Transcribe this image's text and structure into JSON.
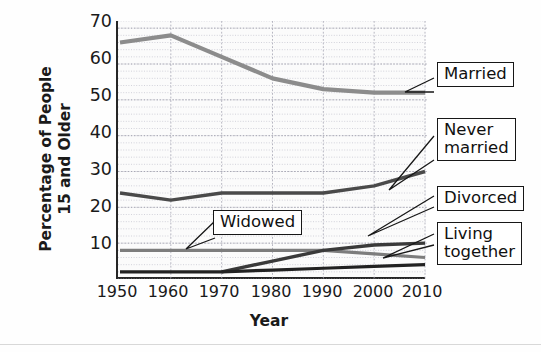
{
  "chart_data": {
    "type": "line",
    "title": "",
    "xlabel": "Year",
    "ylabel": "Percentage of People 15 and Older",
    "ylabel_line1": "Percentage of People",
    "ylabel_line2": "15 and Older",
    "x": [
      1950,
      1960,
      1970,
      1980,
      1990,
      2000,
      2010
    ],
    "xticks": [
      "1950",
      "1960",
      "1970",
      "1980",
      "1990",
      "2000",
      "2010"
    ],
    "yticks": [
      "10",
      "20",
      "30",
      "40",
      "50",
      "60",
      "70"
    ],
    "ytick_values": [
      10,
      20,
      30,
      40,
      50,
      60,
      70
    ],
    "xlim": [
      1950,
      2010
    ],
    "ylim": [
      0,
      72
    ],
    "grid": true,
    "legend_position": "callouts-right",
    "series": [
      {
        "name": "Married",
        "color": "#8c8c8c",
        "x": [
          1950,
          1960,
          1970,
          1980,
          1990,
          2000,
          2010
        ],
        "values": [
          66,
          68,
          62,
          56,
          53,
          52,
          52
        ]
      },
      {
        "name": "Never married",
        "color": "#4a4a4a",
        "x": [
          1950,
          1960,
          1970,
          1980,
          1990,
          2000,
          2010
        ],
        "values": [
          24,
          22,
          24,
          24,
          24,
          26,
          30
        ]
      },
      {
        "name": "Widowed",
        "color": "#7d7d7d",
        "x": [
          1950,
          1960,
          1970,
          1980,
          1990,
          2000,
          2010
        ],
        "values": [
          8,
          8,
          8,
          8,
          8,
          7,
          6
        ]
      },
      {
        "name": "Divorced",
        "color": "#3a3a3a",
        "x": [
          1970,
          1980,
          1990,
          2000,
          2010
        ],
        "values": [
          2,
          5,
          8,
          9.5,
          10
        ]
      },
      {
        "name": "Living together",
        "color": "#222222",
        "x": [
          1950,
          1960,
          1970,
          1980,
          1990,
          2000,
          2010
        ],
        "values": [
          2,
          2,
          2,
          2.5,
          3,
          3.5,
          4
        ]
      }
    ],
    "annotations": [
      {
        "label": "Married",
        "target_series": "Married"
      },
      {
        "label": "Never\nmarried",
        "target_series": "Never married"
      },
      {
        "label": "Widowed",
        "target_series": "Widowed"
      },
      {
        "label": "Divorced",
        "target_series": "Divorced"
      },
      {
        "label": "Living\ntogether",
        "target_series": "Living together"
      }
    ]
  },
  "callouts": {
    "married": "Married",
    "never_married": "Never\nmarried",
    "widowed": "Widowed",
    "divorced": "Divorced",
    "living_together": "Living\ntogether"
  },
  "axes": {
    "x_title": "Year",
    "y_title_line1": "Percentage of People",
    "y_title_line2": "15 and Older",
    "y_tick_70": "70",
    "y_tick_60": "60",
    "y_tick_50": "50",
    "y_tick_40": "40",
    "y_tick_30": "30",
    "y_tick_20": "20",
    "y_tick_10": "10",
    "x_tick_1950": "1950",
    "x_tick_1960": "1960",
    "x_tick_1970": "1970",
    "x_tick_1980": "1980",
    "x_tick_1990": "1990",
    "x_tick_2000": "2000",
    "x_tick_2010": "2010"
  },
  "colors": {
    "married_line": "#8c8c8c",
    "never_married_line": "#4a4a4a",
    "widowed_line": "#7d7d7d",
    "divorced_line": "#3a3a3a",
    "living_together_line": "#222222",
    "axis": "#262626",
    "grid": "#b9b9c6",
    "plot_background": "#fbfbfb"
  }
}
